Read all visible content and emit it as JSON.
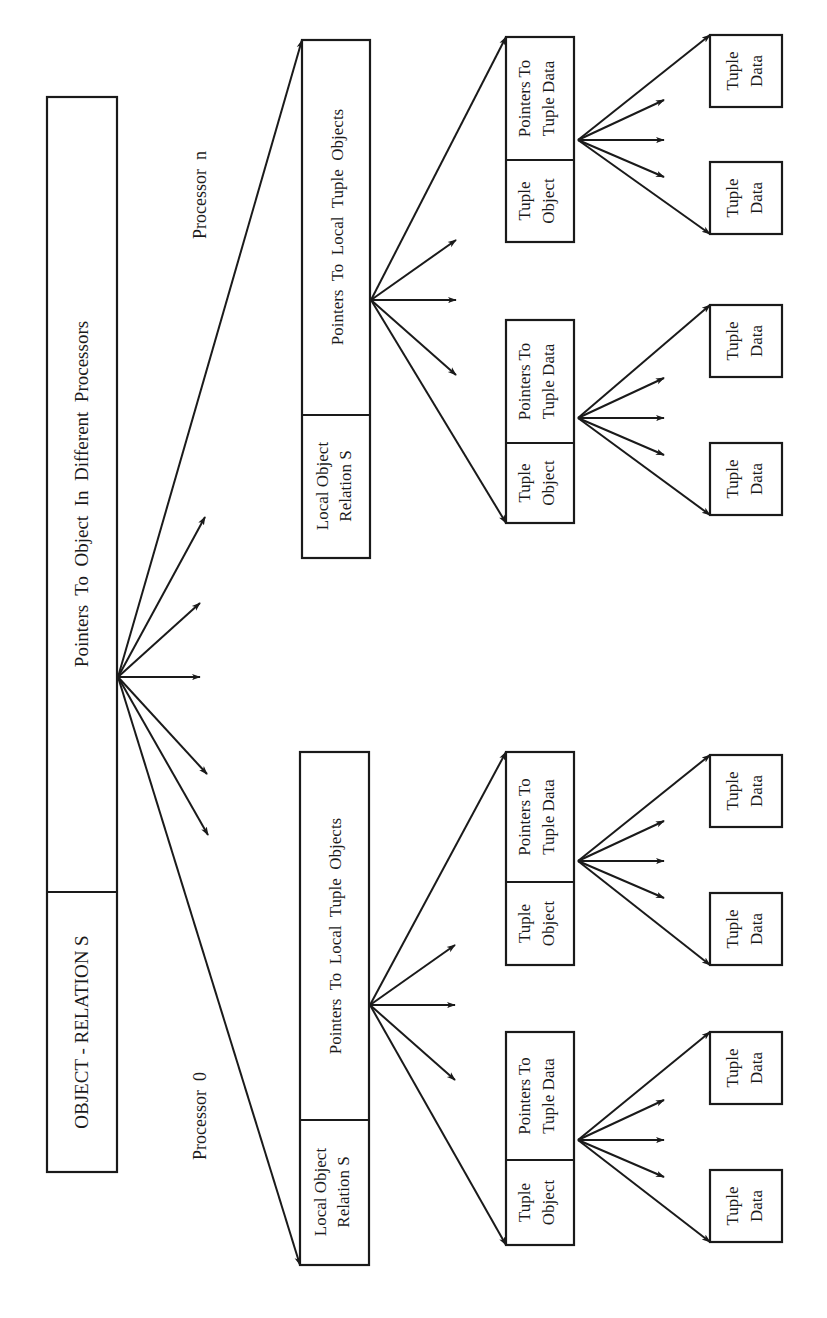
{
  "diagram": {
    "orientation": "rotated 90 degrees counterclockwise",
    "root": {
      "name_label": "OBJECT - RELATION S",
      "pointers_label": "Pointers  To  Object  In  Different  Processors"
    },
    "processors": [
      {
        "label": "Processor  0",
        "local_relation": {
          "name_lines": [
            "Local Object",
            "Relation S"
          ],
          "pointers_label": "Pointers  To  Local  Tuple  Objects"
        },
        "tuples": [
          {
            "object_lines": [
              "Tuple",
              "Object"
            ],
            "pointers_lines": [
              "Pointers To",
              "Tuple Data"
            ],
            "data": [
              [
                "Tuple",
                "Data"
              ],
              [
                "Tuple",
                "Data"
              ]
            ]
          },
          {
            "object_lines": [
              "Tuple",
              "Object"
            ],
            "pointers_lines": [
              "Pointers To",
              "Tuple Data"
            ],
            "data": [
              [
                "Tuple",
                "Data"
              ],
              [
                "Tuple",
                "Data"
              ]
            ]
          }
        ]
      },
      {
        "label": "Processor  n",
        "local_relation": {
          "name_lines": [
            "Local Object",
            "Relation S"
          ],
          "pointers_label": "Pointers  To  Local  Tuple  Objects"
        },
        "tuples": [
          {
            "object_lines": [
              "Tuple",
              "Object"
            ],
            "pointers_lines": [
              "Pointers To",
              "Tuple Data"
            ],
            "data": [
              [
                "Tuple",
                "Data"
              ],
              [
                "Tuple",
                "Data"
              ]
            ]
          },
          {
            "object_lines": [
              "Tuple",
              "Object"
            ],
            "pointers_lines": [
              "Pointers To",
              "Tuple Data"
            ],
            "data": [
              [
                "Tuple",
                "Data"
              ],
              [
                "Tuple",
                "Data"
              ]
            ]
          }
        ]
      }
    ]
  }
}
